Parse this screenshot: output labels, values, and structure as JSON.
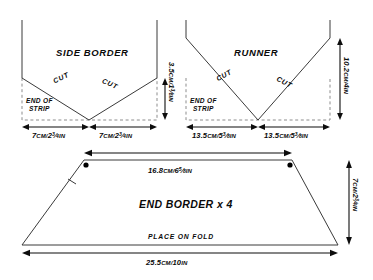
{
  "diagram": {
    "type": "sewing-pattern-cutting-layout",
    "panels": [
      {
        "id": "side-border",
        "title": "SIDE BORDER",
        "cut_label_left": "CUT",
        "cut_label_right": "CUT",
        "end_of_strip_line1": "END OF",
        "end_of_strip_line2": "STRIP",
        "dimensions": {
          "height_right": {
            "cm": "3.5",
            "unit_cm": "CM/",
            "inch_whole": "1",
            "frac_num": "3",
            "frac_den": "8",
            "unit_in": "IN",
            "full": "3.5cm/1⅜in"
          },
          "width_left": {
            "cm": "7",
            "unit_cm": "CM/",
            "inch_whole": "2",
            "frac_num": "3",
            "frac_den": "4",
            "unit_in": "IN",
            "full": "7cm/2¾in"
          },
          "width_right": {
            "cm": "7",
            "unit_cm": "CM/",
            "inch_whole": "2",
            "frac_num": "3",
            "frac_den": "4",
            "unit_in": "IN",
            "full": "7cm/2¾in"
          }
        }
      },
      {
        "id": "runner",
        "title": "RUNNER",
        "cut_label_left": "CUT",
        "cut_label_right": "CUT",
        "end_of_strip_line1": "END OF",
        "end_of_strip_line2": "STRIP",
        "dimensions": {
          "height_right": {
            "cm": "10.2",
            "unit_cm": "CM/",
            "inch_whole": "4",
            "frac_num": "",
            "frac_den": "",
            "unit_in": "IN",
            "full": "10.2cm/4in"
          },
          "width_left": {
            "cm": "13.5",
            "unit_cm": "CM/",
            "inch_whole": "5",
            "frac_num": "3",
            "frac_den": "8",
            "unit_in": "IN",
            "full": "13.5cm/5⅜in"
          },
          "width_right": {
            "cm": "13.5",
            "unit_cm": "CM/",
            "inch_whole": "5",
            "frac_num": "3",
            "frac_den": "8",
            "unit_in": "IN",
            "full": "13.5cm/5⅜in"
          }
        }
      },
      {
        "id": "end-border",
        "title": "END BORDER x 4",
        "fold_label": "PLACE ON FOLD",
        "dimensions": {
          "top": {
            "cm": "16.8",
            "unit_cm": "CM/",
            "inch_whole": "6",
            "frac_num": "5",
            "frac_den": "8",
            "unit_in": "IN",
            "full": "16.8cm/6⅝in"
          },
          "height_right": {
            "cm": "7",
            "unit_cm": "CM/",
            "inch_whole": "2",
            "frac_num": "3",
            "frac_den": "4",
            "unit_in": "IN",
            "full": "7cm/2¾in"
          },
          "bottom": {
            "cm": "25.5",
            "unit_cm": "CM/",
            "inch_whole": "10",
            "frac_num": "",
            "frac_den": "",
            "unit_in": "IN",
            "full": "25.5cm/10in"
          }
        }
      }
    ],
    "colors": {
      "outline": "#3a3a3a",
      "dashed": "#8d8d8d",
      "dimension": "#0d0d0d",
      "text": "#0a0a0a",
      "background": "#ffffff"
    },
    "markers": {
      "dot_count": 2,
      "notch_count": 1
    }
  }
}
